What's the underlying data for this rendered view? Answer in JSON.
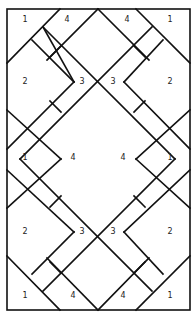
{
  "diagram": {
    "type": "tiling-layout",
    "line_color": "#111111",
    "background": "#ffffff",
    "labels": [
      {
        "text": "1",
        "x": 25,
        "y": 20
      },
      {
        "text": "4",
        "x": 67,
        "y": 20
      },
      {
        "text": "4",
        "x": 127,
        "y": 20
      },
      {
        "text": "1",
        "x": 170,
        "y": 20
      },
      {
        "text": "2",
        "x": 25,
        "y": 82
      },
      {
        "text": "3",
        "x": 82,
        "y": 82
      },
      {
        "text": "3",
        "x": 113,
        "y": 82
      },
      {
        "text": "2",
        "x": 170,
        "y": 82
      },
      {
        "text": "1",
        "x": 25,
        "y": 158
      },
      {
        "text": "4",
        "x": 73,
        "y": 158
      },
      {
        "text": "4",
        "x": 123,
        "y": 158
      },
      {
        "text": "1",
        "x": 170,
        "y": 158
      },
      {
        "text": "2",
        "x": 25,
        "y": 232
      },
      {
        "text": "3",
        "x": 82,
        "y": 232
      },
      {
        "text": "3",
        "x": 113,
        "y": 232
      },
      {
        "text": "2",
        "x": 170,
        "y": 232
      },
      {
        "text": "1",
        "x": 25,
        "y": 296
      },
      {
        "text": "4",
        "x": 73,
        "y": 296
      },
      {
        "text": "4",
        "x": 123,
        "y": 296
      },
      {
        "text": "1",
        "x": 170,
        "y": 296
      }
    ]
  }
}
